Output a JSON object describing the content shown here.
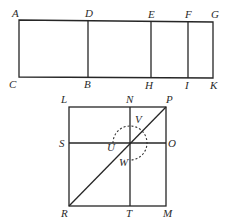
{
  "figure": {
    "top_rectangle": {
      "corner_labels": {
        "top_left": "A",
        "bottom_left": "C",
        "top_right": "G",
        "bottom_right": "K"
      },
      "dividers": [
        {
          "top": "D",
          "bottom": "B"
        },
        {
          "top": "E",
          "bottom": "H"
        },
        {
          "top": "F",
          "bottom": "I"
        }
      ]
    },
    "square": {
      "corner_labels": {
        "top_left": "L",
        "top_right": "P",
        "bottom_left": "R",
        "bottom_right": "M"
      },
      "vertical_line": {
        "top": "N",
        "bottom": "T"
      },
      "horizontal_line": {
        "left": "S",
        "right": "O"
      },
      "diagonal": {
        "from": "R",
        "to": "P"
      },
      "arc_labels": {
        "start": "U",
        "top": "V",
        "end": "W"
      },
      "arc_style": "dashed"
    },
    "colors": {
      "line": "#262626",
      "text": "#2a2a2a",
      "background": "#ffffff"
    }
  }
}
